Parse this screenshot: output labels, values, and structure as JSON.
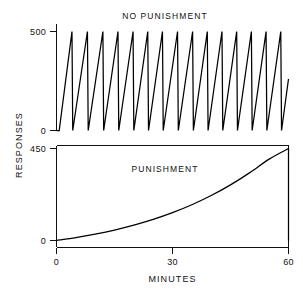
{
  "figure": {
    "background_color": "#ffffff",
    "line_color": "#000000",
    "axis_label_y": "RESPONSES",
    "axis_label_x": "MINUTES"
  },
  "chart_data": [
    {
      "type": "line",
      "title": "NO PUNISHMENT",
      "panel": "upper",
      "xlabel": "MINUTES",
      "ylabel": "RESPONSES",
      "xlim": [
        0,
        60
      ],
      "ylim": [
        0,
        500
      ],
      "xticks": [
        0,
        30,
        60
      ],
      "xtick_labels": [
        "0",
        "30",
        "60"
      ],
      "yticks": [
        0,
        500
      ],
      "ytick_labels": [
        "0",
        "500"
      ],
      "grid": false,
      "legend": "none",
      "description": "Cumulative response record showing a rapid steady response rate; the pen resets to zero each time 500 responses accumulate, producing a repeating sawtooth of 15 ramps across the 60 minute session.",
      "series": [
        {
          "name": "Cumulative responses (no punishment)",
          "reset_value": 500,
          "resets": 15,
          "x": [
            0.0,
            0.7,
            4.0,
            4.2,
            8.0,
            8.2,
            12.0,
            12.2,
            15.9,
            16.1,
            19.8,
            20.0,
            23.6,
            23.8,
            27.4,
            27.6,
            31.3,
            31.5,
            35.2,
            35.4,
            39.0,
            39.2,
            42.8,
            43.0,
            46.6,
            46.8,
            50.4,
            50.6,
            54.2,
            54.4,
            58.0,
            58.2,
            60.0
          ],
          "y": [
            0,
            0,
            500,
            0,
            500,
            0,
            500,
            0,
            500,
            0,
            500,
            0,
            500,
            0,
            500,
            0,
            500,
            0,
            500,
            0,
            500,
            0,
            500,
            0,
            500,
            0,
            500,
            0,
            500,
            0,
            500,
            0,
            260
          ]
        }
      ]
    },
    {
      "type": "line",
      "title": "PUNISHMENT",
      "panel": "lower",
      "xlabel": "MINUTES",
      "ylabel": "RESPONSES",
      "xlim": [
        0,
        60
      ],
      "ylim": [
        0,
        450
      ],
      "xticks": [
        0,
        30,
        60
      ],
      "xtick_labels": [
        "0",
        "30",
        "60"
      ],
      "yticks": [
        0,
        450
      ],
      "ytick_labels": [
        "0",
        "450"
      ],
      "grid": false,
      "legend": "none",
      "description": "Cumulative response record under punishment: responding is suppressed at the start and accelerates positively, reaching 450 cumulative responses at 60 minutes, where the record resets to zero.",
      "series": [
        {
          "name": "Cumulative responses (punishment)",
          "x": [
            0,
            5,
            10,
            15,
            20,
            25,
            30,
            35,
            40,
            45,
            50,
            55,
            60,
            60
          ],
          "y": [
            0,
            14,
            31,
            51,
            75,
            103,
            136,
            175,
            220,
            272,
            332,
            398,
            450,
            0
          ]
        }
      ]
    }
  ]
}
